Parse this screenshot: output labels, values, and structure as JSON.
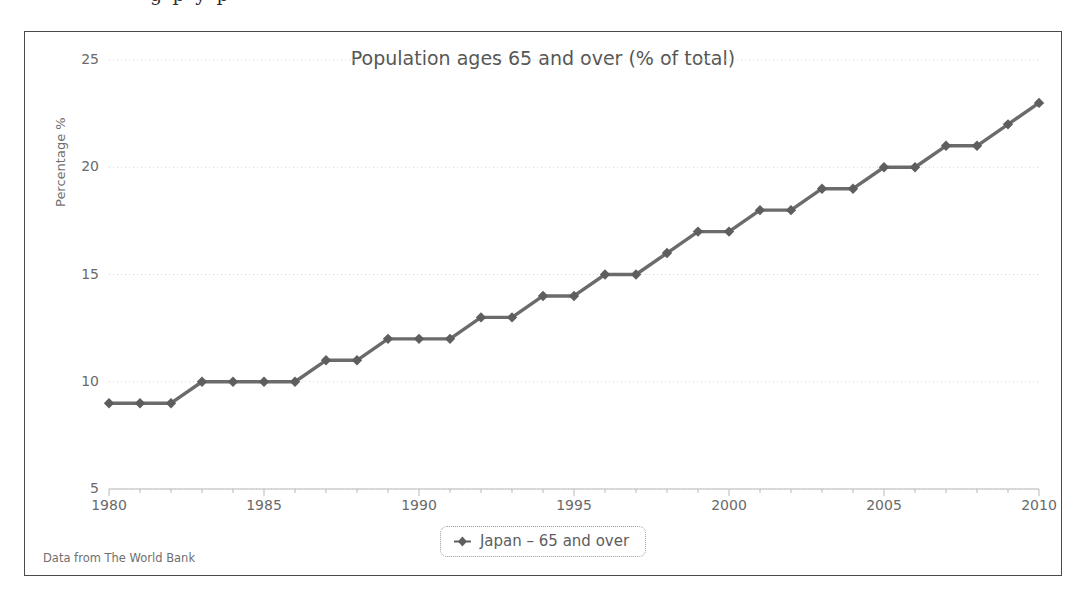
{
  "page": {
    "bleed_text_above": "g   p y       p"
  },
  "chart_card": {
    "source_note": "Data from The World Bank",
    "legend": {
      "marker_icon": "diamond-marker-icon",
      "label": "Japan – 65 and over"
    }
  },
  "style": {
    "series_color": "#6b6b6b",
    "marker_color": "#5e5e5e",
    "gridline_color": "#d6d6d6",
    "axis_color": "#b9b9b9",
    "text_color": "#6a6a6a",
    "border_color": "#4a4a4a"
  },
  "chart_data": {
    "type": "line",
    "title": "Population ages 65 and over (% of total)",
    "xlabel": "",
    "ylabel": "Percentage %",
    "xlim": [
      1980,
      2010
    ],
    "ylim": [
      5,
      25
    ],
    "yticks": [
      5,
      10,
      15,
      20,
      25
    ],
    "xticks": [
      1980,
      1985,
      1990,
      1995,
      2000,
      2005,
      2010
    ],
    "minor_x_tick_step": 1,
    "grid": "horizontal-dotted",
    "legend_position": "bottom-center",
    "series": [
      {
        "name": "Japan – 65 and over",
        "x": [
          1980,
          1981,
          1982,
          1983,
          1984,
          1985,
          1986,
          1987,
          1988,
          1989,
          1990,
          1991,
          1992,
          1993,
          1994,
          1995,
          1996,
          1997,
          1998,
          1999,
          2000,
          2001,
          2002,
          2003,
          2004,
          2005,
          2006,
          2007,
          2008,
          2009,
          2010
        ],
        "values": [
          9,
          9,
          9,
          10,
          10,
          10,
          10,
          11,
          11,
          12,
          12,
          12,
          13,
          13,
          14,
          14,
          15,
          15,
          16,
          17,
          17,
          18,
          18,
          19,
          19,
          20,
          20,
          21,
          21,
          22,
          23
        ]
      }
    ]
  }
}
